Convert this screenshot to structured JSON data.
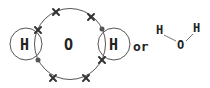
{
  "diagram": {
    "atoms": {
      "hydrogen_left": "H",
      "oxygen": "O",
      "hydrogen_right": "H"
    },
    "connector": "or",
    "structural_formula": {
      "h_left": "H",
      "o": "O",
      "h_right": "H"
    },
    "electron_legend": {
      "oxygen_electron": "cross",
      "hydrogen_electron": "dot"
    },
    "colors": {
      "line": "#555555",
      "text": "#222222",
      "electron": "#333333"
    }
  }
}
